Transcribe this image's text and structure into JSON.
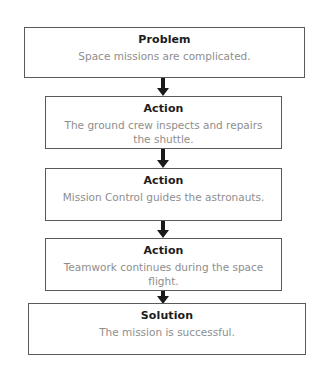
{
  "diagram": {
    "type": "problem-action-solution-flowchart",
    "nodes": [
      {
        "id": "problem",
        "title": "Problem",
        "body": "Space missions are complicated."
      },
      {
        "id": "action-1",
        "title": "Action",
        "body": "The ground crew inspects and repairs the shuttle."
      },
      {
        "id": "action-2",
        "title": "Action",
        "body": "Mission Control guides the astronauts."
      },
      {
        "id": "action-3",
        "title": "Action",
        "body": "Teamwork continues during the space flight."
      },
      {
        "id": "solution",
        "title": "Solution",
        "body": "The mission is successful."
      }
    ],
    "connectors": [
      {
        "id": "arrow-1",
        "from": "problem",
        "to": "action-1",
        "glyph": "down-arrow"
      },
      {
        "id": "arrow-2",
        "from": "action-1",
        "to": "action-2",
        "glyph": "down-arrow"
      },
      {
        "id": "arrow-3",
        "from": "action-2",
        "to": "action-3",
        "glyph": "down-arrow"
      },
      {
        "id": "arrow-4",
        "from": "action-3",
        "to": "solution",
        "glyph": "down-arrow"
      }
    ],
    "colors": {
      "background": "#ffffff",
      "box_border": "#5a5a5a",
      "title_text": "#1c1c1c",
      "body_text": "#8e8e8e",
      "arrow": "#1a1a1a"
    }
  }
}
